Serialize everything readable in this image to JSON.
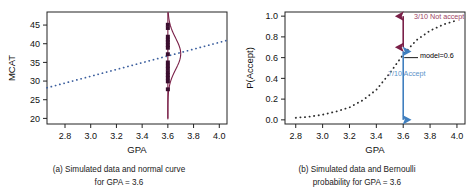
{
  "figure": {
    "background": "#ffffff"
  },
  "colors": {
    "regression_line": "#3c5f9e",
    "normal_curve": "#7a2048",
    "data_point": "#3a0d2e",
    "axis": "#222222",
    "not_accept_arrow": "#7a2048",
    "not_accept_text": "#9c3f63",
    "accept_arrow": "#3f7fbf",
    "accept_text": "#5b92c9",
    "model_leader": "#000000",
    "model_text": "#000000"
  },
  "panel_a": {
    "caption_line1": "(a) Simulated data and normal curve",
    "caption_line2": "for GPA = 3.6",
    "chart_data": {
      "type": "scatter",
      "title": "",
      "xlabel": "GPA",
      "ylabel": "MCAT",
      "xlim": [
        2.66,
        4.06
      ],
      "ylim": [
        18.5,
        48.5
      ],
      "xticks": [
        2.8,
        3.0,
        3.2,
        3.4,
        3.6,
        3.8,
        4.0
      ],
      "xticklabels": [
        "2.8",
        "3.0",
        "3.2",
        "3.4",
        "3.6",
        "3.8",
        "4.0"
      ],
      "yticks": [
        20,
        25,
        30,
        35,
        40,
        45
      ],
      "yticklabels": [
        "20",
        "25",
        "30",
        "35",
        "40",
        "45"
      ],
      "grid": false,
      "legend": "none",
      "series": [
        {
          "name": "Simulated MCAT at GPA = 3.6",
          "type": "scatter",
          "x": [
            3.6,
            3.6,
            3.6,
            3.6,
            3.6,
            3.6,
            3.6,
            3.6,
            3.6,
            3.6,
            3.6,
            3.6,
            3.6,
            3.6,
            3.6,
            3.6
          ],
          "y": [
            45.1,
            44.2,
            41.9,
            41.1,
            40.4,
            39.6,
            38.9,
            37.2,
            35.0,
            34.1,
            33.3,
            32.4,
            31.6,
            30.8,
            29.9,
            27.8
          ]
        },
        {
          "name": "Regression line",
          "type": "line",
          "style": "dotted",
          "x": [
            2.66,
            4.06
          ],
          "y": [
            28.2,
            40.9
          ]
        },
        {
          "name": "Normal density curve at GPA = 3.6",
          "type": "line",
          "style": "solid",
          "mean": 37.3,
          "sd": 4.2,
          "baseline_x": 3.6,
          "max_width": 0.1,
          "y_from": 20.0,
          "y_to": 48.4
        }
      ]
    }
  },
  "panel_b": {
    "caption_line1": "(b) Simulated data and Bernoulli",
    "caption_line2": "probability for GPA = 3.6",
    "annotations": {
      "not_accept": "3/10 Not accept",
      "accept": "7/10 Accept",
      "model": "model=0.6"
    },
    "chart_data": {
      "type": "line",
      "title": "",
      "xlabel": "GPA",
      "ylabel": "P(Accept)",
      "xlim": [
        2.72,
        4.06
      ],
      "ylim": [
        -0.04,
        1.04
      ],
      "xticks": [
        2.8,
        3.0,
        3.2,
        3.4,
        3.6,
        3.8,
        4.0
      ],
      "xticklabels": [
        "2.8",
        "3.0",
        "3.2",
        "3.4",
        "3.6",
        "3.8",
        "4.0"
      ],
      "yticks": [
        0.0,
        0.2,
        0.4,
        0.6,
        0.8,
        1.0
      ],
      "yticklabels": [
        "0.0",
        "0.2",
        "0.4",
        "0.6",
        "0.8",
        "1.0"
      ],
      "grid": false,
      "legend": "none",
      "series": [
        {
          "name": "Logistic probability curve",
          "type": "line",
          "style": "dotted",
          "x": [
            2.8,
            2.9,
            3.0,
            3.1,
            3.2,
            3.3,
            3.4,
            3.5,
            3.6,
            3.7,
            3.8,
            3.9,
            4.0
          ],
          "y": [
            0.02,
            0.03,
            0.05,
            0.08,
            0.12,
            0.19,
            0.29,
            0.45,
            0.63,
            0.77,
            0.86,
            0.92,
            0.96
          ]
        }
      ],
      "markers": [
        {
          "name": "not-accept-segment",
          "x": 3.6,
          "y_from": 0.7,
          "y_to": 1.0,
          "value": 0.3,
          "label": "3/10 Not accept"
        },
        {
          "name": "accept-segment",
          "x": 3.6,
          "y_from": 0.0,
          "y_to": 0.66,
          "value": 0.7,
          "label": "7/10 Accept"
        },
        {
          "name": "model-reference",
          "x": 3.6,
          "y": 0.6,
          "value": 0.6,
          "label": "model=0.6"
        }
      ]
    }
  }
}
